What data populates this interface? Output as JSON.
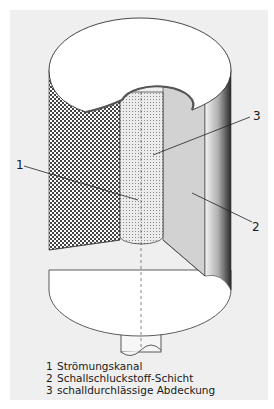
{
  "figure": {
    "callouts": [
      {
        "id": "1",
        "label": "1"
      },
      {
        "id": "2",
        "label": "2"
      },
      {
        "id": "3",
        "label": "3"
      }
    ],
    "colors": {
      "background": "#efefef",
      "top_cover": "#ffffff",
      "absorber_layer": "#bdbdbd",
      "flow_channel": "#e0e0e0",
      "outline": "#333333"
    }
  },
  "legend": {
    "items": [
      {
        "num": "1",
        "text": "Strömungskanal"
      },
      {
        "num": "2",
        "text": "Schallschluckstoff-Schicht"
      },
      {
        "num": "3",
        "text": "schalldurchlässige Abdeckung"
      }
    ]
  }
}
